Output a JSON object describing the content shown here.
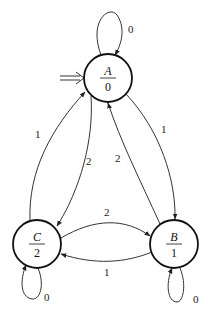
{
  "diagram": {
    "type": "moore-state-machine",
    "start_state": "A",
    "states": [
      {
        "id": "A",
        "name": "A",
        "output": "0",
        "cx": 108,
        "cy": 78,
        "r": 24
      },
      {
        "id": "B",
        "name": "B",
        "output": "1",
        "cx": 174,
        "cy": 244,
        "r": 24
      },
      {
        "id": "C",
        "name": "C",
        "output": "2",
        "cx": 37,
        "cy": 244,
        "r": 24
      }
    ],
    "transitions": [
      {
        "from": "A",
        "to": "A",
        "label": "0"
      },
      {
        "from": "A",
        "to": "B",
        "label": "1"
      },
      {
        "from": "B",
        "to": "A",
        "label": "2"
      },
      {
        "from": "A",
        "to": "C",
        "label": "2"
      },
      {
        "from": "C",
        "to": "A",
        "label": "1"
      },
      {
        "from": "C",
        "to": "B",
        "label": "2"
      },
      {
        "from": "B",
        "to": "C",
        "label": "1"
      },
      {
        "from": "B",
        "to": "B",
        "label": "0"
      },
      {
        "from": "C",
        "to": "C",
        "label": "0"
      }
    ]
  },
  "labels": {
    "A_name": "A",
    "A_out": "0",
    "B_name": "B",
    "B_out": "1",
    "C_name": "C",
    "C_out": "2",
    "t_AA": "0",
    "t_AB": "1",
    "t_BA": "2",
    "t_AC": "2",
    "t_CA": "1",
    "t_CB": "2",
    "t_BC": "1",
    "t_BB": "0",
    "t_CC": "0"
  }
}
